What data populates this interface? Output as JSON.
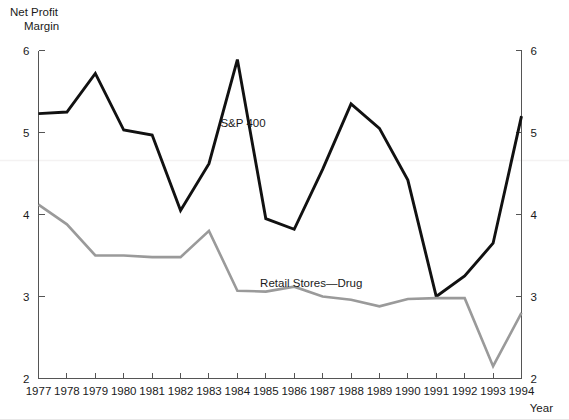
{
  "chart_data": {
    "type": "line",
    "title": "",
    "ylabel": "Net Profit Margin",
    "ylabel_line1": "Net Profit",
    "ylabel_line2": "Margin",
    "xlabel": "Year",
    "categories": [
      1977,
      1978,
      1979,
      1980,
      1981,
      1982,
      1983,
      1984,
      1985,
      1986,
      1987,
      1988,
      1989,
      1990,
      1991,
      1992,
      1993,
      1994
    ],
    "x_tick_labels": [
      "1977",
      "1978",
      "1979",
      "1980",
      "1981",
      "1982",
      "1983",
      "1984",
      "1985",
      "1986",
      "1987",
      "1988",
      "1989",
      "1990",
      "1991",
      "1992",
      "1993",
      "1994"
    ],
    "y_tick_labels_left": [
      "6",
      "5",
      "4",
      "3",
      "2"
    ],
    "y_tick_labels_right": [
      "6",
      "5",
      "4",
      "3",
      "2"
    ],
    "y_ticks": [
      6,
      5,
      4,
      3,
      2
    ],
    "ylim": [
      2,
      6
    ],
    "xlim": [
      1977,
      1994
    ],
    "grid": false,
    "legend_position": "inline-annotation",
    "series": [
      {
        "name": "S&P 400",
        "color": "#111111",
        "stroke_width": 2.9,
        "label_x": 1984.2,
        "label_y": 5.07,
        "values": [
          5.23,
          5.25,
          5.72,
          5.03,
          4.97,
          4.05,
          4.62,
          5.89,
          3.95,
          3.82,
          4.55,
          5.35,
          5.05,
          4.42,
          3.0,
          3.25,
          3.65,
          5.2
        ]
      },
      {
        "name": "Retail Stores—Drug",
        "color": "#9a9a9a",
        "stroke_width": 2.6,
        "label_x": 1986.6,
        "label_y": 3.12,
        "values": [
          4.12,
          3.88,
          3.5,
          3.5,
          3.48,
          3.48,
          3.8,
          3.07,
          3.06,
          3.12,
          3.0,
          2.96,
          2.88,
          2.97,
          2.98,
          2.98,
          2.15,
          2.8
        ]
      }
    ]
  },
  "annotations": {
    "series_labels": [
      "S&P 400",
      "Retail Stores—Drug"
    ]
  }
}
